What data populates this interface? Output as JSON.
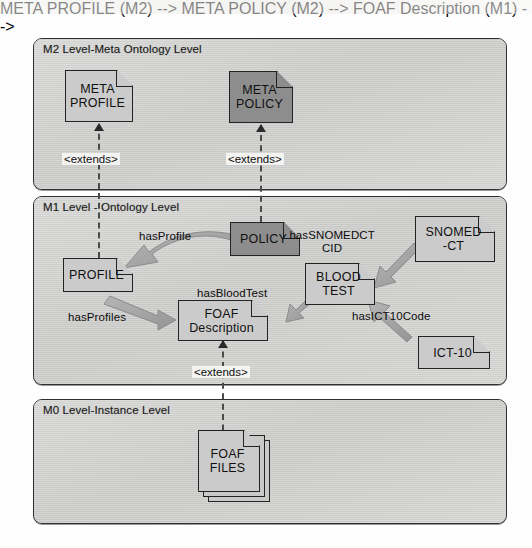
{
  "diagram": {
    "levels": [
      {
        "id": "m2",
        "label": "M2 Level-Meta Ontology Level"
      },
      {
        "id": "m1",
        "label": "M1 Level - Ontology Level"
      },
      {
        "id": "m0",
        "label": "M0 Level-Instance Level"
      }
    ],
    "nodes": {
      "meta_profile": {
        "line1": "META",
        "line2": "PROFILE",
        "shade": "light"
      },
      "meta_policy": {
        "line1": "META",
        "line2": "POLICY",
        "shade": "dark"
      },
      "profile": {
        "line1": "PROFILE",
        "line2": "",
        "shade": "light"
      },
      "policy": {
        "line1": "POLICY",
        "line2": "",
        "shade": "dark"
      },
      "foaf_description": {
        "line1": "FOAF",
        "line2": "Description",
        "shade": "light"
      },
      "blood_test": {
        "line1": "BLOOD",
        "line2": "TEST",
        "shade": "light"
      },
      "snomed_ct": {
        "line1": "SNOMED",
        "line2": "-CT",
        "shade": "light"
      },
      "ict_10": {
        "line1": "ICT-10",
        "line2": "",
        "shade": "light"
      },
      "foaf_files": {
        "line1": "FOAF",
        "line2": "FILES",
        "shade": "light"
      }
    },
    "relations": {
      "extends_profile": "<extends>",
      "extends_policy": "<extends>",
      "extends_foaf": "<extends>",
      "has_profile": "hasProfile",
      "has_profiles": "hasProfiles",
      "has_blood_test": "hasBloodTest",
      "has_snomedct_cid_line1": "hasSNOMEDCT",
      "has_snomedct_cid_line2": "CID",
      "has_ict10_code": "hasICT10Code"
    },
    "colors": {
      "panel_fill": "#cfcfcf",
      "node_fill_light": "#c3c3c3",
      "node_fill_dark": "#8d8d8d",
      "stroke": "#232323",
      "arrow_gray": "#a8a8a8",
      "arrow_gray_dark": "#8f8f8f"
    }
  }
}
